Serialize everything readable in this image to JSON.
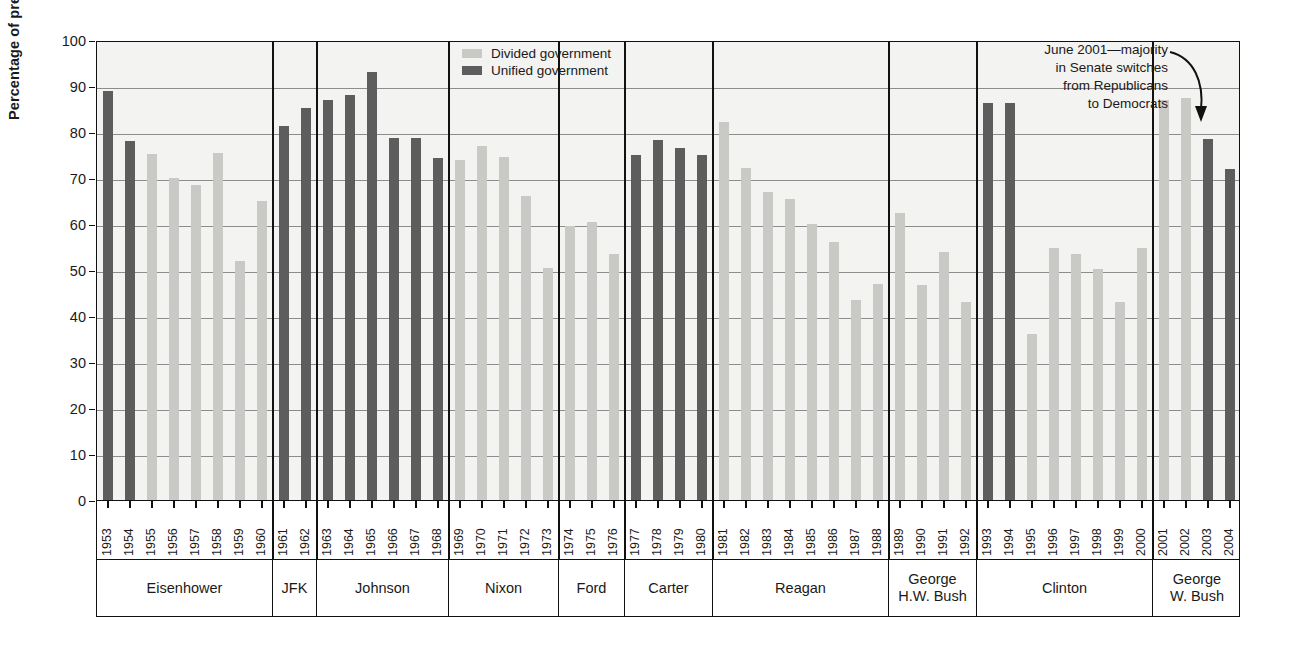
{
  "axis": {
    "ylabel": "Percentage of presidents' bills passed",
    "yticks": [
      0,
      10,
      20,
      30,
      40,
      50,
      60,
      70,
      80,
      90,
      100
    ]
  },
  "legend": {
    "items": [
      {
        "label": "Divided government",
        "color": "#c9c9c5",
        "key": "divided"
      },
      {
        "label": "Unified government",
        "color": "#5d5d5d",
        "key": "unified"
      }
    ]
  },
  "annotation": {
    "lines": [
      "June 2001—majority",
      "in Senate switches",
      "from Republicans",
      "to Democrats"
    ],
    "target_year": "2001"
  },
  "presidents": [
    {
      "name": "Eisenhower",
      "years": [
        "1953",
        "1954",
        "1955",
        "1956",
        "1957",
        "1958",
        "1959",
        "1960"
      ]
    },
    {
      "name": "JFK",
      "years": [
        "1961",
        "1962"
      ]
    },
    {
      "name": "Johnson",
      "years": [
        "1963",
        "1964",
        "1965",
        "1966",
        "1967",
        "1968"
      ]
    },
    {
      "name": "Nixon",
      "years": [
        "1969",
        "1970",
        "1971",
        "1972",
        "1973"
      ]
    },
    {
      "name": "Ford",
      "years": [
        "1974",
        "1975",
        "1976"
      ]
    },
    {
      "name": "Carter",
      "years": [
        "1977",
        "1978",
        "1979",
        "1980"
      ]
    },
    {
      "name": "Reagan",
      "years": [
        "1981",
        "1982",
        "1983",
        "1984",
        "1985",
        "1986",
        "1987",
        "1988"
      ]
    },
    {
      "name": "George\nH.W. Bush",
      "years": [
        "1989",
        "1990",
        "1991",
        "1992"
      ]
    },
    {
      "name": "Clinton",
      "years": [
        "1993",
        "1994",
        "1995",
        "1996",
        "1997",
        "1998",
        "1999",
        "2000"
      ]
    },
    {
      "name": "George\nW. Bush",
      "years": [
        "2001",
        "2002",
        "2003",
        "2004"
      ]
    }
  ],
  "chart_data": {
    "type": "bar",
    "title": "",
    "xlabel": "",
    "ylabel": "Percentage of presidents' bills passed",
    "ylim": [
      0,
      100
    ],
    "grid": true,
    "legend_position": "top-center",
    "categories": [
      "1953",
      "1954",
      "1955",
      "1956",
      "1957",
      "1958",
      "1959",
      "1960",
      "1961",
      "1962",
      "1963",
      "1964",
      "1965",
      "1966",
      "1967",
      "1968",
      "1969",
      "1970",
      "1971",
      "1972",
      "1973",
      "1974",
      "1975",
      "1976",
      "1977",
      "1978",
      "1979",
      "1980",
      "1981",
      "1982",
      "1983",
      "1984",
      "1985",
      "1986",
      "1987",
      "1988",
      "1989",
      "1990",
      "1991",
      "1992",
      "1993",
      "1994",
      "1995",
      "1996",
      "1997",
      "1998",
      "1999",
      "2000",
      "2001",
      "2002",
      "2003",
      "2004"
    ],
    "values": [
      89.0,
      78.0,
      75.2,
      70.0,
      68.5,
      75.5,
      52.0,
      65.0,
      81.2,
      85.2,
      87.0,
      88.0,
      93.0,
      78.6,
      78.6,
      74.3,
      74.0,
      77.0,
      74.5,
      66.0,
      50.5,
      59.5,
      60.5,
      53.5,
      75.0,
      78.2,
      76.5,
      75.0,
      82.2,
      72.2,
      67.0,
      65.5,
      60.0,
      56.0,
      43.5,
      47.0,
      62.5,
      46.8,
      54.0,
      43.0,
      86.2,
      86.2,
      36.0,
      54.7,
      53.4,
      50.2,
      43.0,
      54.7,
      87.0,
      87.5,
      78.5,
      72.0
    ],
    "government": [
      "unified",
      "unified",
      "divided",
      "divided",
      "divided",
      "divided",
      "divided",
      "divided",
      "unified",
      "unified",
      "unified",
      "unified",
      "unified",
      "unified",
      "unified",
      "unified",
      "divided",
      "divided",
      "divided",
      "divided",
      "divided",
      "divided",
      "divided",
      "divided",
      "unified",
      "unified",
      "unified",
      "unified",
      "divided",
      "divided",
      "divided",
      "divided",
      "divided",
      "divided",
      "divided",
      "divided",
      "divided",
      "divided",
      "divided",
      "divided",
      "unified",
      "unified",
      "divided",
      "divided",
      "divided",
      "divided",
      "divided",
      "divided",
      "divided",
      "divided",
      "unified",
      "unified"
    ],
    "series": [
      {
        "name": "Divided government",
        "color": "#c9c9c5"
      },
      {
        "name": "Unified government",
        "color": "#5d5d5d"
      }
    ]
  }
}
